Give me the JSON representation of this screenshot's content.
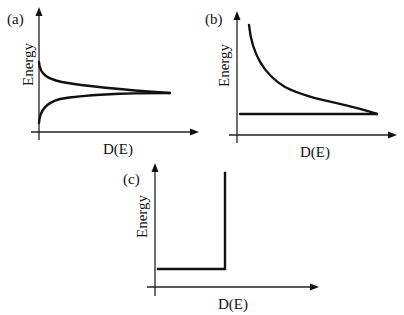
{
  "figure": {
    "panels": [
      {
        "id": "a",
        "label": "(a)",
        "ylabel": "Energy",
        "xlabel": "D(E)",
        "shape": "1D: two branches diverging toward the band edge, 1/sqrt(E) singularity approached from above and below"
      },
      {
        "id": "b",
        "label": "(b)",
        "ylabel": "Energy",
        "xlabel": "D(E)",
        "shape": "decaying curve approaching a horizontal baseline"
      },
      {
        "id": "c",
        "label": "(c)",
        "ylabel": "Energy",
        "xlabel": "D(E)",
        "shape": "step: horizontal segment then vertical rise"
      }
    ]
  },
  "colors": {
    "ink": "#111111",
    "background": "#ffffff"
  }
}
